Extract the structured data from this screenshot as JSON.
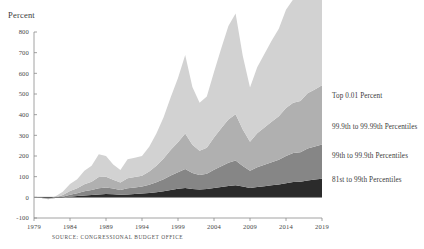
{
  "figure": {
    "y_axis_title": "Percent",
    "source_note": "SOURCE: CONGRESSIONAL BUDGET OFFICE"
  },
  "legend": {
    "items": [
      {
        "label": "Top 0.01 Percent",
        "color": "#d2d2d2"
      },
      {
        "label": "99.9th to 99.99th Percentiles",
        "color": "#b0b0b0"
      },
      {
        "label": "99th to 99.9th Percentiles",
        "color": "#868686"
      },
      {
        "label": "81st to 99th Percentiles",
        "color": "#2b2b2b"
      }
    ]
  },
  "chart_data": {
    "type": "area",
    "stacked": true,
    "title": "",
    "xlabel": "",
    "ylabel": "Percent",
    "xlim": [
      1979,
      2019
    ],
    "ylim": [
      -100,
      800
    ],
    "ytick_step": 100,
    "yticks": [
      800,
      700,
      600,
      500,
      400,
      300,
      200,
      100,
      0,
      -100
    ],
    "xticks": [
      1979,
      1984,
      1989,
      1994,
      1999,
      2004,
      2009,
      2014,
      2019
    ],
    "grid": false,
    "legend_position": "right",
    "x": [
      1979,
      1980,
      1981,
      1982,
      1983,
      1984,
      1985,
      1986,
      1987,
      1988,
      1989,
      1990,
      1991,
      1992,
      1993,
      1994,
      1995,
      1996,
      1997,
      1998,
      1999,
      2000,
      2001,
      2002,
      2003,
      2004,
      2005,
      2006,
      2007,
      2008,
      2009,
      2010,
      2011,
      2012,
      2013,
      2014,
      2015,
      2016,
      2017,
      2018,
      2019
    ],
    "series": [
      {
        "name": "81st to 99th Percentiles",
        "color": "#2b2b2b",
        "values": [
          0,
          -2,
          -4,
          -3,
          -1,
          3,
          6,
          9,
          11,
          14,
          16,
          15,
          12,
          14,
          16,
          18,
          21,
          25,
          30,
          36,
          41,
          45,
          40,
          38,
          40,
          45,
          50,
          55,
          58,
          52,
          45,
          50,
          54,
          58,
          62,
          68,
          74,
          76,
          82,
          86,
          90
        ]
      },
      {
        "name": "99th to 99.9th Percentiles",
        "color": "#868686",
        "values": [
          0,
          -1,
          -3,
          0,
          4,
          10,
          14,
          20,
          24,
          30,
          32,
          28,
          24,
          30,
          32,
          34,
          40,
          48,
          58,
          70,
          80,
          92,
          78,
          70,
          74,
          88,
          100,
          112,
          120,
          100,
          84,
          96,
          104,
          112,
          120,
          132,
          140,
          142,
          154,
          160,
          166
        ]
      },
      {
        "name": "99.9th to 99.99th Percentiles",
        "color": "#b0b0b0",
        "values": [
          0,
          0,
          -2,
          2,
          8,
          18,
          24,
          34,
          40,
          54,
          52,
          42,
          36,
          48,
          50,
          52,
          64,
          80,
          100,
          124,
          146,
          172,
          136,
          118,
          126,
          156,
          184,
          210,
          224,
          176,
          140,
          164,
          180,
          196,
          210,
          232,
          244,
          248,
          268,
          276,
          286
        ]
      },
      {
        "name": "Top 0.01 Percent",
        "color": "#d2d2d2",
        "values": [
          0,
          2,
          0,
          6,
          16,
          34,
          44,
          66,
          78,
          110,
          100,
          74,
          60,
          92,
          94,
          96,
          120,
          156,
          200,
          256,
          310,
          380,
          280,
          232,
          248,
          318,
          386,
          452,
          488,
          356,
          262,
          320,
          356,
          392,
          424,
          476,
          500,
          504,
          548,
          564,
          586
        ]
      }
    ]
  }
}
